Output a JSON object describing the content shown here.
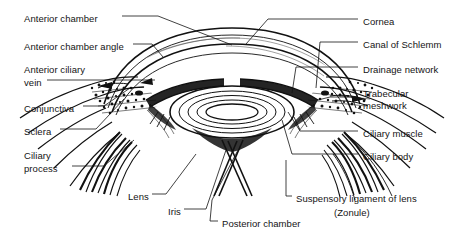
{
  "figure": {
    "background_color": "#ffffff",
    "ink_color": "#111111",
    "style": "black-and-white engraving / stipple line art"
  },
  "labels_left": [
    {
      "id": "anterior-chamber",
      "text": "Anterior chamber",
      "x": 24,
      "y": 13
    },
    {
      "id": "anterior-chamber-angle",
      "text": "Anterior chamber angle",
      "x": 24,
      "y": 41
    },
    {
      "id": "anterior-ciliary",
      "text": "Anterior ciliary",
      "x": 24,
      "y": 64
    },
    {
      "id": "vein",
      "text": "vein",
      "x": 24,
      "y": 77
    },
    {
      "id": "conjunctiva",
      "text": "Conjunctiva",
      "x": 24,
      "y": 103
    },
    {
      "id": "sclera",
      "text": "Sclera",
      "x": 24,
      "y": 126
    },
    {
      "id": "ciliary",
      "text": "Ciliary",
      "x": 24,
      "y": 150
    },
    {
      "id": "process",
      "text": "process",
      "x": 24,
      "y": 163
    }
  ],
  "labels_right": [
    {
      "id": "cornea",
      "text": "Cornea",
      "x": 363,
      "y": 16
    },
    {
      "id": "canal-of-schlemm",
      "text": "Canal of Schlemm",
      "x": 363,
      "y": 39
    },
    {
      "id": "drainage-network",
      "text": "Drainage network",
      "x": 363,
      "y": 64
    },
    {
      "id": "trabecular",
      "text": "Trabecular",
      "x": 363,
      "y": 88
    },
    {
      "id": "meshwork",
      "text": "meshwork",
      "x": 363,
      "y": 100
    },
    {
      "id": "ciliary-muscle",
      "text": "Ciliary muscle",
      "x": 363,
      "y": 128
    },
    {
      "id": "ciliary-body",
      "text": "Ciliary body",
      "x": 363,
      "y": 151
    }
  ],
  "labels_bottom": [
    {
      "id": "lens",
      "text": "Lens",
      "x": 128,
      "y": 191
    },
    {
      "id": "iris",
      "text": "Iris",
      "x": 168,
      "y": 206
    },
    {
      "id": "posterior-chamber",
      "text": "Posterior chamber",
      "x": 222,
      "y": 218
    },
    {
      "id": "suspensory-ligament-of-lens",
      "text": "Suspensory ligament of lens",
      "x": 296,
      "y": 193
    },
    {
      "id": "zonule",
      "text": "(Zonule)",
      "x": 334,
      "y": 207
    }
  ]
}
